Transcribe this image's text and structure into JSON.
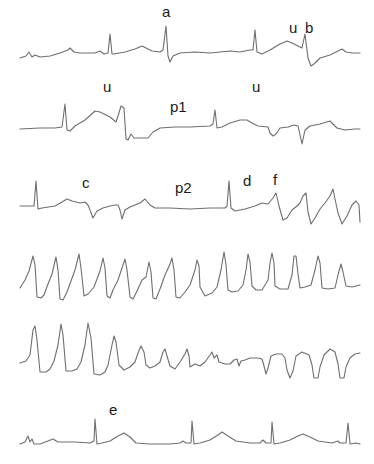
{
  "figure": {
    "type": "ecg-rhythm-strips",
    "strip_count": 6,
    "trace_color": "#6e6e6e",
    "label_color": "#1a1a1a"
  },
  "labels": {
    "a": "a",
    "u1": "u",
    "b": "b",
    "u2": "u",
    "u3": "u",
    "p1": "p1",
    "c": "c",
    "p2": "p2",
    "d": "d",
    "f": "f",
    "e": "e"
  },
  "strips": [
    {
      "id": 1,
      "labels": [
        "a",
        "u",
        "b"
      ]
    },
    {
      "id": 2,
      "labels": [
        "u",
        "p1",
        "u"
      ]
    },
    {
      "id": 3,
      "labels": [
        "c",
        "p2",
        "d",
        "f"
      ]
    },
    {
      "id": 4,
      "labels": []
    },
    {
      "id": 5,
      "labels": []
    },
    {
      "id": 6,
      "labels": [
        "e"
      ]
    }
  ]
}
